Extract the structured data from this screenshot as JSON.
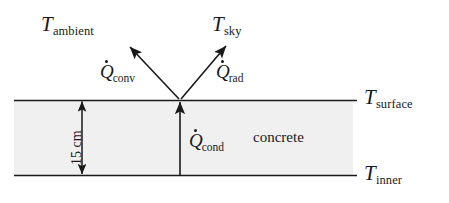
{
  "figure": {
    "type": "heat-transfer-schematic",
    "background_color": "#ffffff",
    "line_color": "#1a1a1a",
    "slab_fill_color": "#f0f0f0"
  },
  "labels": {
    "ambient": {
      "symbol": "T",
      "subscript": "ambient"
    },
    "sky": {
      "symbol": "T",
      "subscript": "sky"
    },
    "q_conv": {
      "symbol": "Q",
      "subscript": "conv",
      "overdot": true
    },
    "q_rad": {
      "symbol": "Q",
      "subscript": "rad",
      "overdot": true
    },
    "q_cond": {
      "symbol": "Q",
      "subscript": "cond",
      "overdot": true
    },
    "t_surface": {
      "symbol": "T",
      "subscript": "surface"
    },
    "t_inner": {
      "symbol": "T",
      "subscript": "inner"
    },
    "material": "concrete",
    "thickness": "15 cm"
  },
  "geometry": {
    "slab_left": 14,
    "slab_right": 353,
    "line_right": 357,
    "surface_y": 100,
    "inner_y": 175,
    "node_x": 180,
    "dimension_arrow_x": 82,
    "conv_arrow_tip": {
      "x": 128,
      "y": 45
    },
    "rad_arrow_tip": {
      "x": 228,
      "y": 44
    }
  }
}
